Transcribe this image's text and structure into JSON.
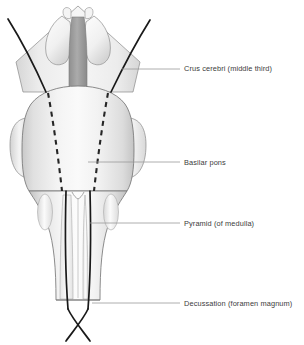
{
  "figure": {
    "background_color": "#ffffff",
    "outline_color": "#6e6e6e",
    "tract_color": "#1a1a1a",
    "label_color": "#3b3b3b",
    "leader_color": "#9a9a9a",
    "fill_light": "#f3f3f3",
    "fill_mid": "#e3e3e3",
    "fill_dark": "#c6c6c6",
    "fill_median": "#9d9d9d"
  },
  "labels": [
    {
      "id": "crus-cerebri",
      "text": "Crus cerebri (middle third)",
      "text_x": 184,
      "text_y": 71,
      "leader": {
        "x1": 122,
        "y1": 69,
        "x2": 180,
        "y2": 69
      }
    },
    {
      "id": "basilar-pons",
      "text": "Basilar pons",
      "text_x": 184,
      "text_y": 165,
      "leader": {
        "x1": 88,
        "y1": 162,
        "x2": 180,
        "y2": 162
      }
    },
    {
      "id": "pyramid",
      "text": "Pyramid (of medulla)",
      "text_x": 184,
      "text_y": 226,
      "leader": {
        "x1": 90,
        "y1": 223,
        "x2": 180,
        "y2": 223
      }
    },
    {
      "id": "decussation",
      "text": "Decussation (foramen magnum)",
      "text_x": 184,
      "text_y": 306,
      "leader": {
        "x1": 92,
        "y1": 303,
        "x2": 180,
        "y2": 303
      }
    }
  ],
  "structures": [
    {
      "id": "midbrain-cut-surface",
      "name": "midbrain cut surface (rhomboid)"
    },
    {
      "id": "mammillary-body-left",
      "name": "left mammillary body"
    },
    {
      "id": "mammillary-body-right",
      "name": "right mammillary body"
    },
    {
      "id": "interpeduncular-median",
      "name": "interpeduncular median band"
    },
    {
      "id": "basilar-pons-body",
      "name": "basilar pons"
    },
    {
      "id": "middle-cerebellar-peduncle-left",
      "name": "left middle cerebellar peduncle"
    },
    {
      "id": "middle-cerebellar-peduncle-right",
      "name": "right middle cerebellar peduncle"
    },
    {
      "id": "medulla-oblongata",
      "name": "medulla oblongata"
    },
    {
      "id": "olive-left",
      "name": "left olive"
    },
    {
      "id": "olive-right",
      "name": "right olive"
    },
    {
      "id": "pyramid-left",
      "name": "left pyramid"
    },
    {
      "id": "pyramid-right",
      "name": "right pyramid"
    },
    {
      "id": "anterior-median-fissure",
      "name": "anterior median fissure"
    },
    {
      "id": "corticospinal-tract-left",
      "name": "left corticospinal tract"
    },
    {
      "id": "corticospinal-tract-right",
      "name": "right corticospinal tract"
    },
    {
      "id": "pyramidal-decussation",
      "name": "pyramidal decussation"
    },
    {
      "id": "crus-dashed-left",
      "name": "left crus cerebri dashed course"
    },
    {
      "id": "crus-dashed-right",
      "name": "right crus cerebri dashed course"
    }
  ]
}
